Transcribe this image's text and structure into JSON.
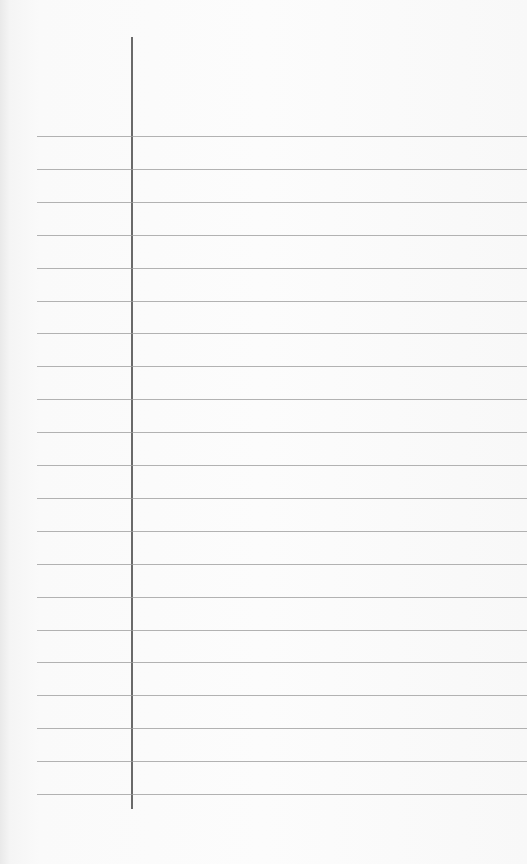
{
  "page": {
    "type": "lined notepad paper",
    "content": "",
    "rule_color": "#9a9a9a",
    "margin_color": "#6a6a6a",
    "background_color": "#fafafa",
    "rule_count": 21,
    "rule_first_y": 136,
    "rule_spacing": 32.9
  }
}
